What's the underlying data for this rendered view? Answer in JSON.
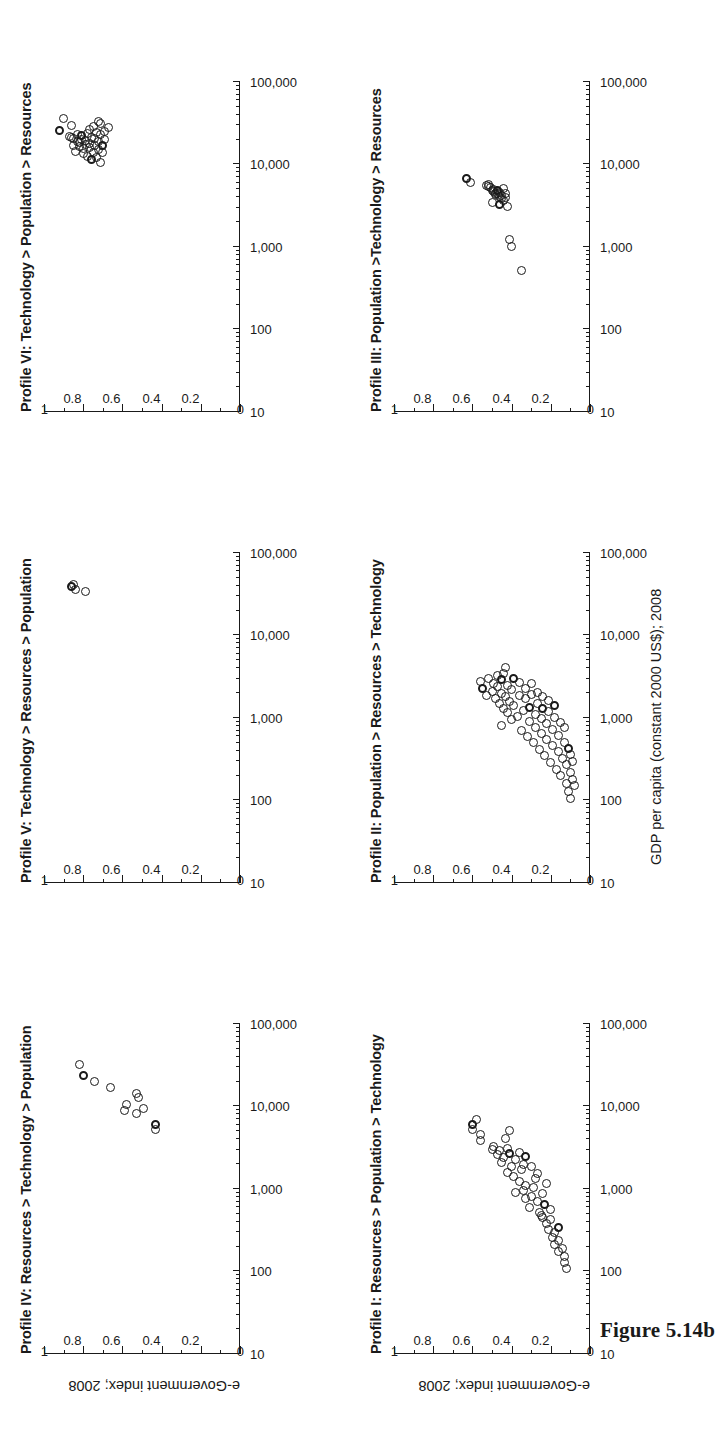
{
  "figure": {
    "caption": "Figure 5.14b",
    "axis_x_title": "GDP per capita (constant 2000 US$); 2008",
    "axis_y_title": "e-Government index; 2008"
  },
  "chart_data": [
    {
      "id": "profile-1",
      "type": "scatter",
      "title": "Profile I: Resources > Population > Technology",
      "xlabel": "GDP per capita (constant 2000 US$); 2008",
      "ylabel": "e-Government index; 2008",
      "xscale": "log",
      "xlim": [
        10,
        100000
      ],
      "ylim": [
        0,
        1
      ],
      "xticks": [
        "10",
        "100",
        "1,000",
        "10,000",
        "100,000"
      ],
      "yticks": [
        "0",
        "0.2",
        "0.4",
        "0.6",
        "0.8",
        "1"
      ],
      "grid": false,
      "legend": null,
      "points": [
        [
          6000,
          0.6
        ],
        [
          7000,
          0.58
        ],
        [
          5200,
          0.6
        ],
        [
          3900,
          0.56
        ],
        [
          4600,
          0.56
        ],
        [
          3000,
          0.5
        ],
        [
          3300,
          0.49
        ],
        [
          2600,
          0.47
        ],
        [
          2900,
          0.46
        ],
        [
          2400,
          0.44
        ],
        [
          2100,
          0.45
        ],
        [
          2700,
          0.41
        ],
        [
          3100,
          0.42
        ],
        [
          4100,
          0.43
        ],
        [
          5100,
          0.41
        ],
        [
          1900,
          0.4
        ],
        [
          2300,
          0.38
        ],
        [
          1600,
          0.42
        ],
        [
          1400,
          0.39
        ],
        [
          1250,
          0.36
        ],
        [
          1700,
          0.35
        ],
        [
          2000,
          0.34
        ],
        [
          2500,
          0.33
        ],
        [
          1100,
          0.33
        ],
        [
          950,
          0.34
        ],
        [
          820,
          0.3
        ],
        [
          1050,
          0.29
        ],
        [
          1350,
          0.28
        ],
        [
          1550,
          0.27
        ],
        [
          600,
          0.31
        ],
        [
          700,
          0.27
        ],
        [
          520,
          0.26
        ],
        [
          450,
          0.24
        ],
        [
          640,
          0.23
        ],
        [
          880,
          0.24
        ],
        [
          1150,
          0.22
        ],
        [
          380,
          0.22
        ],
        [
          320,
          0.21
        ],
        [
          430,
          0.2
        ],
        [
          560,
          0.2
        ],
        [
          260,
          0.19
        ],
        [
          300,
          0.18
        ],
        [
          210,
          0.18
        ],
        [
          240,
          0.16
        ],
        [
          340,
          0.16
        ],
        [
          175,
          0.16
        ],
        [
          190,
          0.14
        ],
        [
          150,
          0.13
        ],
        [
          130,
          0.13
        ],
        [
          110,
          0.12
        ],
        [
          480,
          0.25
        ],
        [
          760,
          0.33
        ],
        [
          1900,
          0.3
        ],
        [
          2800,
          0.36
        ],
        [
          900,
          0.38
        ]
      ]
    },
    {
      "id": "profile-2",
      "type": "scatter",
      "title": "Profile II: Population > Resources > Technology",
      "xlabel": "GDP per capita (constant 2000 US$); 2008",
      "ylabel": "e-Government index; 2008",
      "xscale": "log",
      "xlim": [
        10,
        100000
      ],
      "ylim": [
        0,
        1
      ],
      "xticks": [
        "10",
        "100",
        "1,000",
        "10,000",
        "100,000"
      ],
      "yticks": [
        "0",
        "0.2",
        "0.4",
        "0.6",
        "0.8",
        "1"
      ],
      "grid": false,
      "legend": null,
      "points": [
        [
          2300,
          0.55
        ],
        [
          2800,
          0.56
        ],
        [
          1900,
          0.53
        ],
        [
          3000,
          0.52
        ],
        [
          2100,
          0.5
        ],
        [
          2600,
          0.49
        ],
        [
          1700,
          0.48
        ],
        [
          2400,
          0.47
        ],
        [
          3300,
          0.47
        ],
        [
          1500,
          0.46
        ],
        [
          2000,
          0.45
        ],
        [
          2900,
          0.45
        ],
        [
          1300,
          0.44
        ],
        [
          1800,
          0.43
        ],
        [
          2500,
          0.42
        ],
        [
          3500,
          0.44
        ],
        [
          4100,
          0.43
        ],
        [
          1150,
          0.42
        ],
        [
          1600,
          0.41
        ],
        [
          2200,
          0.4
        ],
        [
          950,
          0.4
        ],
        [
          1400,
          0.39
        ],
        [
          3000,
          0.39
        ],
        [
          800,
          0.45
        ],
        [
          1050,
          0.37
        ],
        [
          1900,
          0.36
        ],
        [
          2700,
          0.36
        ],
        [
          700,
          0.35
        ],
        [
          1250,
          0.34
        ],
        [
          1700,
          0.33
        ],
        [
          2300,
          0.33
        ],
        [
          600,
          0.32
        ],
        [
          900,
          0.31
        ],
        [
          1350,
          0.31
        ],
        [
          1950,
          0.3
        ],
        [
          2600,
          0.3
        ],
        [
          500,
          0.29
        ],
        [
          760,
          0.28
        ],
        [
          1100,
          0.28
        ],
        [
          1500,
          0.27
        ],
        [
          2050,
          0.27
        ],
        [
          420,
          0.26
        ],
        [
          650,
          0.25
        ],
        [
          980,
          0.25
        ],
        [
          1300,
          0.24
        ],
        [
          1800,
          0.24
        ],
        [
          350,
          0.23
        ],
        [
          550,
          0.22
        ],
        [
          850,
          0.22
        ],
        [
          1200,
          0.21
        ],
        [
          1650,
          0.21
        ],
        [
          290,
          0.2
        ],
        [
          460,
          0.19
        ],
        [
          720,
          0.19
        ],
        [
          1000,
          0.18
        ],
        [
          1400,
          0.18
        ],
        [
          240,
          0.17
        ],
        [
          390,
          0.16
        ],
        [
          610,
          0.16
        ],
        [
          880,
          0.15
        ],
        [
          200,
          0.15
        ],
        [
          320,
          0.14
        ],
        [
          510,
          0.13
        ],
        [
          760,
          0.13
        ],
        [
          160,
          0.12
        ],
        [
          270,
          0.12
        ],
        [
          430,
          0.11
        ],
        [
          130,
          0.11
        ],
        [
          220,
          0.1
        ],
        [
          360,
          0.1
        ],
        [
          105,
          0.1
        ],
        [
          180,
          0.09
        ],
        [
          300,
          0.09
        ],
        [
          150,
          0.08
        ]
      ]
    },
    {
      "id": "profile-3",
      "type": "scatter",
      "title": "Profile III: Population >Technology > Resources",
      "xlabel": "GDP per capita (constant 2000 US$); 2008",
      "ylabel": "e-Government index; 2008",
      "xscale": "log",
      "xlim": [
        10,
        100000
      ],
      "ylim": [
        0,
        1
      ],
      "xticks": [
        "10",
        "100",
        "1,000",
        "10,000",
        "100,000"
      ],
      "yticks": [
        "0",
        "0.2",
        "0.4",
        "0.6",
        "0.8",
        "1"
      ],
      "grid": false,
      "legend": null,
      "points": [
        [
          6800,
          0.63
        ],
        [
          6100,
          0.61
        ],
        [
          5600,
          0.53
        ],
        [
          5400,
          0.52
        ],
        [
          5800,
          0.52
        ],
        [
          5200,
          0.51
        ],
        [
          4900,
          0.5
        ],
        [
          5000,
          0.49
        ],
        [
          4700,
          0.49
        ],
        [
          4500,
          0.48
        ],
        [
          4300,
          0.48
        ],
        [
          4800,
          0.47
        ],
        [
          4400,
          0.47
        ],
        [
          4100,
          0.46
        ],
        [
          4600,
          0.46
        ],
        [
          3900,
          0.45
        ],
        [
          4200,
          0.45
        ],
        [
          5100,
          0.44
        ],
        [
          3700,
          0.44
        ],
        [
          4000,
          0.43
        ],
        [
          4500,
          0.43
        ],
        [
          3500,
          0.5
        ],
        [
          3300,
          0.46
        ],
        [
          3100,
          0.42
        ],
        [
          1250,
          0.41
        ],
        [
          1000,
          0.4
        ],
        [
          520,
          0.35
        ]
      ]
    },
    {
      "id": "profile-4",
      "type": "scatter",
      "title": "Profile IV: Resources > Technology > Population",
      "xlabel": "GDP per capita (constant 2000 US$); 2008",
      "ylabel": "e-Government index; 2008",
      "xscale": "log",
      "xlim": [
        10,
        100000
      ],
      "ylim": [
        0,
        1
      ],
      "xticks": [
        "10",
        "100",
        "1,000",
        "10,000",
        "100,000"
      ],
      "yticks": [
        "0",
        "0.2",
        "0.4",
        "0.6",
        "0.8",
        "1"
      ],
      "grid": false,
      "legend": null,
      "points": [
        [
          24000,
          0.8
        ],
        [
          32000,
          0.82
        ],
        [
          20000,
          0.74
        ],
        [
          17000,
          0.66
        ],
        [
          9000,
          0.59
        ],
        [
          10500,
          0.58
        ],
        [
          8200,
          0.53
        ],
        [
          13000,
          0.52
        ],
        [
          14500,
          0.53
        ],
        [
          9500,
          0.49
        ],
        [
          5200,
          0.43
        ],
        [
          6000,
          0.43
        ]
      ]
    },
    {
      "id": "profile-5",
      "type": "scatter",
      "title": "Profile V: Technology > Resources > Population",
      "xlabel": "GDP per capita (constant 2000 US$); 2008",
      "ylabel": "e-Government index; 2008",
      "xscale": "log",
      "xlim": [
        10,
        100000
      ],
      "ylim": [
        0,
        1
      ],
      "xticks": [
        "10",
        "100",
        "1,000",
        "10,000",
        "100,000"
      ],
      "yticks": [
        "0",
        "0.2",
        "0.4",
        "0.6",
        "0.8",
        "1"
      ],
      "grid": false,
      "legend": null,
      "points": [
        [
          39000,
          0.86
        ],
        [
          42000,
          0.85
        ],
        [
          36000,
          0.84
        ],
        [
          34000,
          0.79
        ]
      ]
    },
    {
      "id": "profile-6",
      "type": "scatter",
      "title": "Profile VI: Technology > Population > Resources",
      "xlabel": "GDP per capita (constant 2000 US$); 2008",
      "ylabel": "e-Government index; 2008",
      "xscale": "log",
      "xlim": [
        10,
        100000
      ],
      "ylim": [
        0,
        1
      ],
      "xticks": [
        "10",
        "100",
        "1,000",
        "10,000",
        "100,000"
      ],
      "yticks": [
        "0",
        "0.2",
        "0.4",
        "0.6",
        "0.8",
        "1"
      ],
      "grid": false,
      "legend": null,
      "points": [
        [
          26000,
          0.92
        ],
        [
          22000,
          0.87
        ],
        [
          20500,
          0.85
        ],
        [
          21500,
          0.86
        ],
        [
          17000,
          0.85
        ],
        [
          14500,
          0.84
        ],
        [
          19000,
          0.83
        ],
        [
          23000,
          0.83
        ],
        [
          16500,
          0.82
        ],
        [
          18500,
          0.82
        ],
        [
          20000,
          0.81
        ],
        [
          22500,
          0.81
        ],
        [
          13500,
          0.8
        ],
        [
          15500,
          0.8
        ],
        [
          17500,
          0.79
        ],
        [
          19500,
          0.79
        ],
        [
          24000,
          0.78
        ],
        [
          12500,
          0.78
        ],
        [
          16000,
          0.77
        ],
        [
          18000,
          0.77
        ],
        [
          21000,
          0.76
        ],
        [
          26500,
          0.77
        ],
        [
          11500,
          0.76
        ],
        [
          14000,
          0.75
        ],
        [
          17200,
          0.74
        ],
        [
          20800,
          0.74
        ],
        [
          24500,
          0.73
        ],
        [
          12000,
          0.73
        ],
        [
          15000,
          0.72
        ],
        [
          18800,
          0.72
        ],
        [
          22800,
          0.71
        ],
        [
          10500,
          0.71
        ],
        [
          13800,
          0.7
        ],
        [
          16800,
          0.7
        ],
        [
          20200,
          0.69
        ],
        [
          25000,
          0.69
        ],
        [
          29000,
          0.75
        ],
        [
          31000,
          0.71
        ],
        [
          28000,
          0.67
        ],
        [
          33000,
          0.72
        ],
        [
          36000,
          0.9
        ],
        [
          30000,
          0.86
        ]
      ]
    }
  ]
}
